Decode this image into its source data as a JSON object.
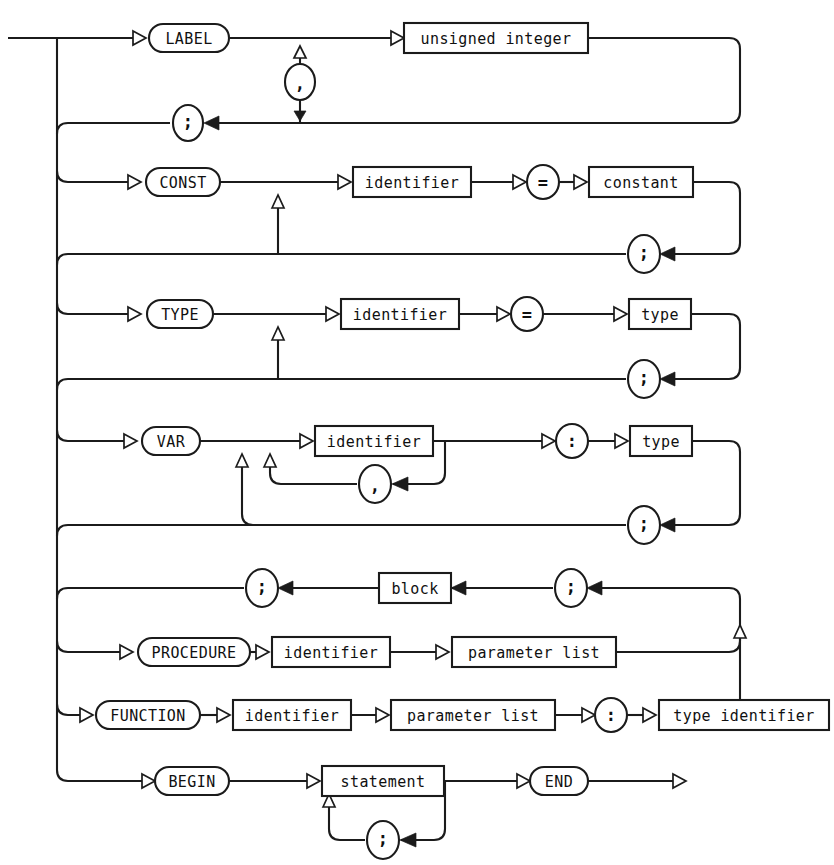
{
  "diagram": {
    "name": "pascal-block-syntax-diagram",
    "type": "railroad-syntax-diagram",
    "title": "block",
    "width": 834,
    "height": 865,
    "ink_color": "#1b1b1b",
    "background_color": "#ffffff"
  },
  "sections": {
    "label": {
      "keyword": "LABEL",
      "item": "unsigned integer",
      "separator": ",",
      "terminator": ";"
    },
    "const": {
      "keyword": "CONST",
      "name": "identifier",
      "equals": "=",
      "value": "constant",
      "separator": ";",
      "terminator": ";"
    },
    "type": {
      "keyword": "TYPE",
      "name": "identifier",
      "equals": "=",
      "value": "type",
      "separator": ";",
      "terminator": ";"
    },
    "var": {
      "keyword": "VAR",
      "name": "identifier",
      "colon": ":",
      "value": "type",
      "name_separator": ",",
      "separator": ";",
      "terminator": ";"
    },
    "routine": {
      "block": "block",
      "left_semicolon": ";",
      "right_semicolon": ";"
    },
    "procedure": {
      "keyword": "PROCEDURE",
      "name": "identifier",
      "params": "parameter list"
    },
    "function": {
      "keyword": "FUNCTION",
      "name": "identifier",
      "params": "parameter list",
      "colon": ":",
      "result_type": "type identifier"
    },
    "body": {
      "keyword_begin": "BEGIN",
      "item": "statement",
      "separator": ";",
      "keyword_end": "END"
    }
  },
  "nodes": [
    {
      "id": "label-keyword",
      "kind": "terminal",
      "text": "LABEL",
      "cx": 189,
      "cy": 38,
      "w": 80,
      "h": 28
    },
    {
      "id": "label-item",
      "kind": "nonterminal",
      "text": "unsigned integer",
      "cx": 496,
      "cy": 38,
      "w": 184,
      "h": 30
    },
    {
      "id": "label-comma",
      "kind": "punct-oval",
      "text": ",",
      "cx": 300,
      "cy": 82,
      "w": 28,
      "h": 34
    },
    {
      "id": "label-semicolon",
      "kind": "punct-oval",
      "text": ";",
      "cx": 188,
      "cy": 123,
      "w": 28,
      "h": 34
    },
    {
      "id": "const-keyword",
      "kind": "terminal",
      "text": "CONST",
      "cx": 183,
      "cy": 182,
      "w": 74,
      "h": 28
    },
    {
      "id": "const-name",
      "kind": "nonterminal",
      "text": "identifier",
      "cx": 412,
      "cy": 182,
      "w": 118,
      "h": 30
    },
    {
      "id": "const-equals",
      "kind": "punct-oval",
      "text": "=",
      "cx": 543,
      "cy": 182,
      "w": 30,
      "h": 30
    },
    {
      "id": "const-value",
      "kind": "nonterminal",
      "text": "constant",
      "cx": 641,
      "cy": 182,
      "w": 104,
      "h": 30
    },
    {
      "id": "const-semicolon",
      "kind": "punct-oval",
      "text": ";",
      "cx": 644,
      "cy": 254,
      "w": 28,
      "h": 34
    },
    {
      "id": "type-keyword",
      "kind": "terminal",
      "text": "TYPE",
      "cx": 180,
      "cy": 314,
      "w": 66,
      "h": 28
    },
    {
      "id": "type-name",
      "kind": "nonterminal",
      "text": "identifier",
      "cx": 400,
      "cy": 314,
      "w": 118,
      "h": 30
    },
    {
      "id": "type-equals",
      "kind": "punct-oval",
      "text": "=",
      "cx": 527,
      "cy": 314,
      "w": 30,
      "h": 30
    },
    {
      "id": "type-value",
      "kind": "nonterminal",
      "text": "type",
      "cx": 660,
      "cy": 314,
      "w": 62,
      "h": 30
    },
    {
      "id": "type-semicolon",
      "kind": "punct-oval",
      "text": ";",
      "cx": 644,
      "cy": 379,
      "w": 28,
      "h": 34
    },
    {
      "id": "var-keyword",
      "kind": "terminal",
      "text": "VAR",
      "cx": 171,
      "cy": 441,
      "w": 58,
      "h": 28
    },
    {
      "id": "var-name",
      "kind": "nonterminal",
      "text": "identifier",
      "cx": 374,
      "cy": 441,
      "w": 118,
      "h": 30
    },
    {
      "id": "var-comma",
      "kind": "punct-oval",
      "text": ",",
      "cx": 375,
      "cy": 484,
      "w": 28,
      "h": 34
    },
    {
      "id": "var-colon",
      "kind": "punct-oval",
      "text": ":",
      "cx": 572,
      "cy": 441,
      "w": 30,
      "h": 30
    },
    {
      "id": "var-value",
      "kind": "nonterminal",
      "text": "type",
      "cx": 661,
      "cy": 441,
      "w": 62,
      "h": 30
    },
    {
      "id": "var-semicolon",
      "kind": "punct-oval",
      "text": ";",
      "cx": 644,
      "cy": 525,
      "w": 28,
      "h": 34
    },
    {
      "id": "routine-semicolon-left",
      "kind": "punct-oval",
      "text": ";",
      "cx": 262,
      "cy": 588,
      "w": 28,
      "h": 34
    },
    {
      "id": "routine-block",
      "kind": "nonterminal",
      "text": "block",
      "cx": 415,
      "cy": 588,
      "w": 72,
      "h": 30
    },
    {
      "id": "routine-semicolon-right",
      "kind": "punct-oval",
      "text": ";",
      "cx": 571,
      "cy": 588,
      "w": 28,
      "h": 34
    },
    {
      "id": "proc-keyword",
      "kind": "terminal",
      "text": "PROCEDURE",
      "cx": 194,
      "cy": 652,
      "w": 112,
      "h": 28
    },
    {
      "id": "proc-name",
      "kind": "nonterminal",
      "text": "identifier",
      "cx": 331,
      "cy": 652,
      "w": 118,
      "h": 30
    },
    {
      "id": "proc-params",
      "kind": "nonterminal",
      "text": "parameter list",
      "cx": 534,
      "cy": 652,
      "w": 164,
      "h": 30
    },
    {
      "id": "func-keyword",
      "kind": "terminal",
      "text": "FUNCTION",
      "cx": 148,
      "cy": 715,
      "w": 104,
      "h": 28
    },
    {
      "id": "func-name",
      "kind": "nonterminal",
      "text": "identifier",
      "cx": 292,
      "cy": 715,
      "w": 118,
      "h": 30
    },
    {
      "id": "func-params",
      "kind": "nonterminal",
      "text": "parameter list",
      "cx": 473,
      "cy": 715,
      "w": 164,
      "h": 30
    },
    {
      "id": "func-colon",
      "kind": "punct-oval",
      "text": ":",
      "cx": 611,
      "cy": 715,
      "w": 30,
      "h": 30
    },
    {
      "id": "func-result",
      "kind": "nonterminal",
      "text": "type identifier",
      "cx": 744,
      "cy": 715,
      "w": 170,
      "h": 30
    },
    {
      "id": "begin-keyword",
      "kind": "terminal",
      "text": "BEGIN",
      "cx": 192,
      "cy": 781,
      "w": 74,
      "h": 28
    },
    {
      "id": "begin-statement",
      "kind": "nonterminal",
      "text": "statement",
      "cx": 383,
      "cy": 781,
      "w": 122,
      "h": 30
    },
    {
      "id": "begin-semicolon",
      "kind": "punct-oval",
      "text": ";",
      "cx": 383,
      "cy": 840,
      "w": 28,
      "h": 34
    },
    {
      "id": "end-keyword",
      "kind": "terminal",
      "text": "END",
      "cx": 559,
      "cy": 781,
      "w": 58,
      "h": 28
    }
  ]
}
